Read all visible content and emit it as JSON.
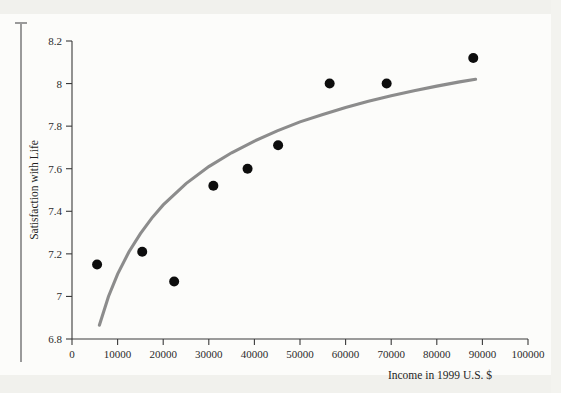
{
  "page": {
    "background_color": "#fcfcfa",
    "margin_rule_color": "#9a9a9a"
  },
  "chart_data": {
    "type": "scatter",
    "title": "",
    "subtitle": "",
    "xlabel": "Income in 1999 U.S. $",
    "ylabel": "Satisfaction with Life",
    "xlim": [
      0,
      100000
    ],
    "ylim": [
      6.8,
      8.2
    ],
    "xticks": [
      0,
      10000,
      20000,
      30000,
      40000,
      50000,
      60000,
      70000,
      80000,
      90000,
      100000
    ],
    "xtick_labels": [
      "0",
      "10000",
      "20000",
      "30000",
      "40000",
      "50000",
      "60000",
      "70000",
      "80000",
      "90000",
      "100000"
    ],
    "yticks": [
      6.8,
      7,
      7.2,
      7.4,
      7.6,
      7.8,
      8,
      8.2
    ],
    "ytick_labels": [
      "6.8",
      "7",
      "7.2",
      "7.4",
      "7.6",
      "7.8",
      "8",
      "8.2"
    ],
    "grid": false,
    "legend": null,
    "legend_position": "none",
    "marker_color": "#0d0d0d",
    "marker_size": 5,
    "points": [
      {
        "x": 5500,
        "y": 7.15
      },
      {
        "x": 15400,
        "y": 7.21
      },
      {
        "x": 22400,
        "y": 7.07
      },
      {
        "x": 31000,
        "y": 7.52
      },
      {
        "x": 38500,
        "y": 7.6
      },
      {
        "x": 45200,
        "y": 7.71
      },
      {
        "x": 56500,
        "y": 8.0
      },
      {
        "x": 69000,
        "y": 8.0
      },
      {
        "x": 88000,
        "y": 8.12
      }
    ],
    "fit_curve": {
      "name": "logarithmic fit",
      "color": "#8c8c8c",
      "width": 3,
      "points": [
        {
          "x": 6000,
          "y": 6.865
        },
        {
          "x": 8000,
          "y": 7.0
        },
        {
          "x": 10000,
          "y": 7.105
        },
        {
          "x": 12500,
          "y": 7.21
        },
        {
          "x": 15000,
          "y": 7.295
        },
        {
          "x": 17500,
          "y": 7.368
        },
        {
          "x": 20000,
          "y": 7.43
        },
        {
          "x": 25000,
          "y": 7.53
        },
        {
          "x": 30000,
          "y": 7.61
        },
        {
          "x": 35000,
          "y": 7.675
        },
        {
          "x": 40000,
          "y": 7.73
        },
        {
          "x": 45000,
          "y": 7.778
        },
        {
          "x": 50000,
          "y": 7.82
        },
        {
          "x": 55000,
          "y": 7.855
        },
        {
          "x": 60000,
          "y": 7.888
        },
        {
          "x": 65000,
          "y": 7.917
        },
        {
          "x": 70000,
          "y": 7.943
        },
        {
          "x": 75000,
          "y": 7.966
        },
        {
          "x": 80000,
          "y": 7.988
        },
        {
          "x": 85000,
          "y": 8.008
        },
        {
          "x": 88500,
          "y": 8.02
        }
      ]
    }
  }
}
